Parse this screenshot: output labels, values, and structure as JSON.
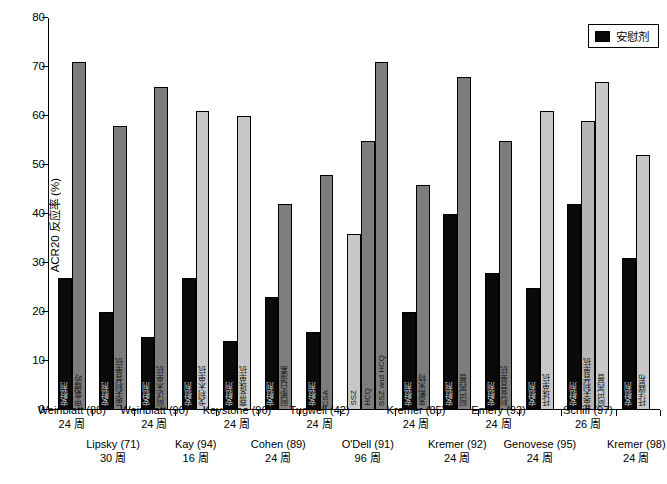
{
  "chart_data": {
    "type": "bar",
    "title": "",
    "xlabel": "",
    "ylabel": "ACR20 反应率 (%)",
    "ylim": [
      0,
      80
    ],
    "ytick_values": [
      0,
      10,
      20,
      30,
      40,
      50,
      60,
      70,
      80
    ],
    "ytick_labels": [
      "0",
      "10",
      "20",
      "30",
      "40",
      "50",
      "60",
      "70",
      "80"
    ],
    "grid": false,
    "legend": {
      "position": "top-right",
      "entries": [
        {
          "label": "安慰剂",
          "color": "#0a0a0a"
        }
      ]
    },
    "colors": {
      "placebo": "#0a0a0a",
      "mid": "#7d7d7d",
      "midlight": "#b5b5b5",
      "light": "#c8c8c8",
      "axis": "#000000",
      "background": "#ffffff"
    },
    "groups": [
      {
        "study": "Weinblatt (88)",
        "duration": "24 周",
        "row": "a",
        "bars": [
          {
            "value": 27,
            "shade": "placebo",
            "inlabel": "安慰剂"
          },
          {
            "value": 71,
            "shade": "mid",
            "inlabel": "甲氨蝶呤"
          }
        ]
      },
      {
        "study": "Lipsky (71)",
        "duration": "30 周",
        "row": "b",
        "bars": [
          {
            "value": 20,
            "shade": "placebo",
            "inlabel": "安慰剂"
          },
          {
            "value": 58,
            "shade": "mid",
            "inlabel": "英夫利昔单抗"
          }
        ]
      },
      {
        "study": "Weinblatt (90)",
        "duration": "24 周",
        "row": "a",
        "bars": [
          {
            "value": 15,
            "shade": "placebo",
            "inlabel": "安慰剂"
          },
          {
            "value": 66,
            "shade": "mid",
            "inlabel": "阿达木单抗"
          }
        ]
      },
      {
        "study": "Kay (94)",
        "duration": "16 周",
        "row": "b",
        "bars": [
          {
            "value": 27,
            "shade": "placebo",
            "inlabel": "安慰剂"
          },
          {
            "value": 61,
            "shade": "light",
            "inlabel": "戈利木单抗"
          }
        ]
      },
      {
        "study": "Keystone (96)",
        "duration": "24 周",
        "row": "a",
        "bars": [
          {
            "value": 14,
            "shade": "placebo",
            "inlabel": "安慰剂"
          },
          {
            "value": 60,
            "shade": "light",
            "inlabel": "赛妥珠单抗"
          }
        ]
      },
      {
        "study": "Cohen (89)",
        "duration": "24 周",
        "row": "b",
        "bars": [
          {
            "value": 23,
            "shade": "placebo",
            "inlabel": "安慰剂"
          },
          {
            "value": 42,
            "shade": "mid",
            "inlabel": "阿那白滞素"
          }
        ]
      },
      {
        "study": "Tugwell (42)",
        "duration": "24 周",
        "row": "a",
        "bars": [
          {
            "value": 16,
            "shade": "placebo",
            "inlabel": "安慰剂"
          },
          {
            "value": 48,
            "shade": "mid",
            "inlabel": "CSA"
          }
        ]
      },
      {
        "study": "O'Dell (91)",
        "duration": "96 周",
        "row": "b",
        "bars": [
          {
            "value": 36,
            "shade": "light",
            "inlabel": "SSZ"
          },
          {
            "value": 55,
            "shade": "mid",
            "inlabel": "HCQ"
          },
          {
            "value": 71,
            "shade": "mid",
            "inlabel": "SSZ and HCQ"
          }
        ]
      },
      {
        "study": "Kremer (85)",
        "duration": "24 周",
        "row": "a",
        "bars": [
          {
            "value": 20,
            "shade": "placebo",
            "inlabel": "安慰剂"
          },
          {
            "value": 46,
            "shade": "mid",
            "inlabel": "来氟米特"
          }
        ]
      },
      {
        "study": "Kremer (92)",
        "duration": "24 周",
        "row": "b",
        "bars": [
          {
            "value": 40,
            "shade": "placebo",
            "inlabel": "安慰剂"
          },
          {
            "value": 68,
            "shade": "mid",
            "inlabel": "阿巴西普"
          }
        ]
      },
      {
        "study": "Emery (93)",
        "duration": "24 周",
        "row": "a",
        "bars": [
          {
            "value": 28,
            "shade": "placebo",
            "inlabel": "安慰剂"
          },
          {
            "value": 55,
            "shade": "mid",
            "inlabel": "利妥昔单抗"
          }
        ]
      },
      {
        "study": "Genovese (95)",
        "duration": "24 周",
        "row": "b",
        "bars": [
          {
            "value": 25,
            "shade": "placebo",
            "inlabel": "安慰剂"
          },
          {
            "value": 61,
            "shade": "light",
            "inlabel": "托珠单抗"
          }
        ]
      },
      {
        "study": "Schiff (97)",
        "duration": "26 周",
        "row": "a",
        "bars": [
          {
            "value": 42,
            "shade": "placebo",
            "inlabel": "安慰剂"
          },
          {
            "value": 59,
            "shade": "midlight",
            "inlabel": "英夫利昔单抗"
          },
          {
            "value": 67,
            "shade": "light",
            "inlabel": "阿巴西普"
          }
        ]
      },
      {
        "study": "Kremer (98)",
        "duration": "24 周",
        "row": "b",
        "bars": [
          {
            "value": 31,
            "shade": "placebo",
            "inlabel": "安慰剂"
          },
          {
            "value": 52,
            "shade": "light",
            "inlabel": "托法替布"
          }
        ]
      }
    ]
  }
}
